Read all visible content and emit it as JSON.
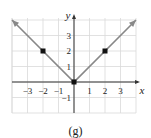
{
  "chart_data": {
    "type": "line",
    "title": "",
    "caption": "(g)",
    "xlabel": "x",
    "ylabel": "y",
    "xlim": [
      -4,
      4
    ],
    "ylim": [
      -2,
      4
    ],
    "grid": true,
    "x_ticks": [
      -3,
      -2,
      -1,
      1,
      2,
      3
    ],
    "y_ticks": [
      -1,
      1,
      2,
      3
    ],
    "x_tick_labels": [
      "−3",
      "−2",
      "−1",
      "1",
      "2",
      "3"
    ],
    "y_tick_labels": [
      "−1",
      "1",
      "2",
      "3"
    ],
    "series": [
      {
        "name": "y = |x|",
        "x": [
          -4,
          0,
          4
        ],
        "y": [
          4,
          0,
          4
        ],
        "arrows": "both-ends",
        "color": "#888888"
      }
    ],
    "points": [
      {
        "x": -2,
        "y": 2
      },
      {
        "x": 0,
        "y": 0
      },
      {
        "x": 2,
        "y": 2
      }
    ],
    "colors": {
      "grid": "#d9d9d9",
      "axis": "#333333",
      "line": "#888888",
      "point": "#111111"
    }
  }
}
